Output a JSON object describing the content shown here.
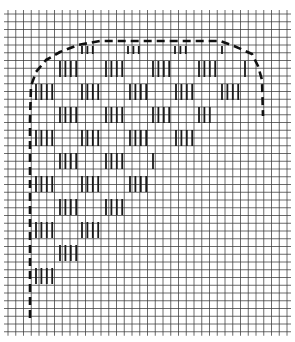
{
  "diagram": {
    "title": "",
    "grid": {
      "x0": 8,
      "y0": 14,
      "cell": 7.75,
      "cols": 36,
      "rows": 41,
      "line_color": "#3a3a3a",
      "line_width": 1
    },
    "outline": {
      "style": "dashed",
      "color": "#111111",
      "width": 2.6,
      "dash": "8,5",
      "points": [
        [
          30,
          318
        ],
        [
          30,
          260
        ],
        [
          30,
          120
        ],
        [
          31,
          86
        ],
        [
          36,
          72
        ],
        [
          46,
          60
        ],
        [
          60,
          52
        ],
        [
          78,
          45
        ],
        [
          100,
          41
        ],
        [
          220,
          41
        ],
        [
          234,
          46
        ],
        [
          252,
          54
        ],
        [
          258,
          66
        ],
        [
          262,
          80
        ],
        [
          263,
          116
        ]
      ]
    },
    "tally_groups": [
      {
        "x": 82,
        "y": 46,
        "h": 8,
        "n": 3
      },
      {
        "x": 128,
        "y": 46,
        "h": 8,
        "n": 3
      },
      {
        "x": 175,
        "y": 46,
        "h": 8,
        "n": 3
      },
      {
        "x": 222,
        "y": 46,
        "h": 8,
        "n": 1
      },
      {
        "x": 60,
        "y": 61,
        "h": 16,
        "n": 4
      },
      {
        "x": 106,
        "y": 61,
        "h": 16,
        "n": 4
      },
      {
        "x": 153,
        "y": 61,
        "h": 16,
        "n": 4
      },
      {
        "x": 199,
        "y": 61,
        "h": 16,
        "n": 4
      },
      {
        "x": 245,
        "y": 61,
        "h": 16,
        "n": 1
      },
      {
        "x": 36,
        "y": 84,
        "h": 16,
        "n": 4
      },
      {
        "x": 82,
        "y": 84,
        "h": 16,
        "n": 4
      },
      {
        "x": 130,
        "y": 84,
        "h": 16,
        "n": 4
      },
      {
        "x": 176,
        "y": 84,
        "h": 16,
        "n": 4
      },
      {
        "x": 222,
        "y": 84,
        "h": 16,
        "n": 4
      },
      {
        "x": 60,
        "y": 107,
        "h": 16,
        "n": 4
      },
      {
        "x": 106,
        "y": 107,
        "h": 16,
        "n": 4
      },
      {
        "x": 153,
        "y": 107,
        "h": 16,
        "n": 4
      },
      {
        "x": 199,
        "y": 107,
        "h": 16,
        "n": 3
      },
      {
        "x": 36,
        "y": 130,
        "h": 16,
        "n": 4
      },
      {
        "x": 82,
        "y": 130,
        "h": 16,
        "n": 4
      },
      {
        "x": 130,
        "y": 130,
        "h": 16,
        "n": 4
      },
      {
        "x": 176,
        "y": 130,
        "h": 16,
        "n": 4
      },
      {
        "x": 60,
        "y": 153,
        "h": 16,
        "n": 4
      },
      {
        "x": 106,
        "y": 153,
        "h": 16,
        "n": 4
      },
      {
        "x": 153,
        "y": 153,
        "h": 16,
        "n": 1
      },
      {
        "x": 36,
        "y": 176,
        "h": 16,
        "n": 4
      },
      {
        "x": 82,
        "y": 176,
        "h": 16,
        "n": 4
      },
      {
        "x": 130,
        "y": 176,
        "h": 16,
        "n": 4
      },
      {
        "x": 60,
        "y": 199,
        "h": 16,
        "n": 4
      },
      {
        "x": 106,
        "y": 199,
        "h": 16,
        "n": 4
      },
      {
        "x": 36,
        "y": 222,
        "h": 16,
        "n": 4
      },
      {
        "x": 82,
        "y": 222,
        "h": 16,
        "n": 4
      },
      {
        "x": 60,
        "y": 245,
        "h": 16,
        "n": 4
      },
      {
        "x": 36,
        "y": 268,
        "h": 16,
        "n": 4
      }
    ],
    "tally_spacing": 5.4,
    "tally_color": "#1a1a1a",
    "tally_width": 1.8
  }
}
